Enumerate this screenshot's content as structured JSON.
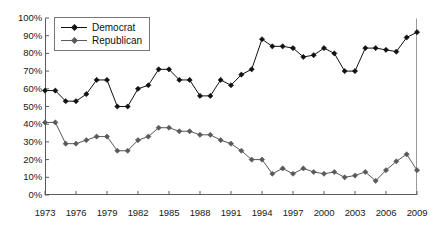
{
  "chart_data": {
    "type": "line",
    "title": "",
    "subtitle": "",
    "xlabel": "",
    "ylabel": "",
    "grid": false,
    "legend_position": "top-left",
    "xlim": [
      1973,
      2009
    ],
    "ylim": [
      0,
      100
    ],
    "y_ticks": [
      "0%",
      "10%",
      "20%",
      "30%",
      "40%",
      "50%",
      "60%",
      "70%",
      "80%",
      "90%",
      "100%"
    ],
    "y_tick_values": [
      0,
      10,
      20,
      30,
      40,
      50,
      60,
      70,
      80,
      90,
      100
    ],
    "x_ticks": [
      "1973",
      "1976",
      "1979",
      "1982",
      "1985",
      "1988",
      "1991",
      "1994",
      "1997",
      "2000",
      "2003",
      "2006",
      "2009"
    ],
    "x_tick_values": [
      1973,
      1976,
      1979,
      1982,
      1985,
      1988,
      1991,
      1994,
      1997,
      2000,
      2003,
      2006,
      2009
    ],
    "x": [
      1973,
      1974,
      1975,
      1976,
      1977,
      1978,
      1979,
      1980,
      1981,
      1982,
      1983,
      1984,
      1985,
      1986,
      1987,
      1988,
      1989,
      1990,
      1991,
      1992,
      1993,
      1994,
      1995,
      1996,
      1997,
      1998,
      1999,
      2000,
      2001,
      2002,
      2003,
      2004,
      2005,
      2006,
      2007,
      2008,
      2009
    ],
    "series": [
      {
        "name": "Democrat",
        "color": "#111111",
        "marker": "diamond",
        "values": [
          59,
          59,
          53,
          53,
          57,
          65,
          65,
          50,
          50,
          60,
          62,
          71,
          71,
          65,
          65,
          56,
          56,
          65,
          62,
          68,
          71,
          88,
          84,
          84,
          83,
          78,
          79,
          83,
          80,
          70,
          70,
          83,
          83,
          82,
          81,
          89,
          92
        ]
      },
      {
        "name": "Republican",
        "color": "#595959",
        "marker": "diamond",
        "values": [
          41,
          41,
          29,
          29,
          31,
          33,
          33,
          25,
          25,
          31,
          33,
          38,
          38,
          36,
          36,
          34,
          34,
          31,
          29,
          25,
          20,
          20,
          12,
          15,
          12,
          15,
          13,
          12,
          13,
          10,
          11,
          13,
          8,
          14,
          19,
          23,
          14
        ]
      }
    ]
  },
  "legend": {
    "items": [
      {
        "label": "Democrat",
        "color": "#111111"
      },
      {
        "label": "Republican",
        "color": "#595959"
      }
    ]
  }
}
